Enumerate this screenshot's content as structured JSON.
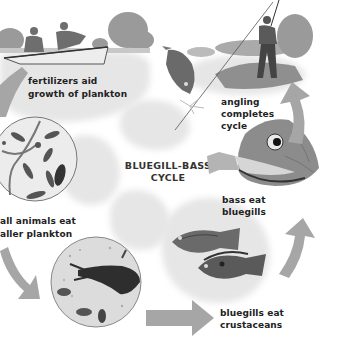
{
  "diagram": {
    "title_line1": "BLUEGILL-BASS",
    "title_line2": "CYCLE",
    "color_mode": "grayscale",
    "arrow_color": "#a6a6a6",
    "stages": [
      {
        "id": "fertilizers",
        "line1": "fertilizers aid",
        "line2": "growth of plankton",
        "illustration": "two men in rowboat fertilizing pond"
      },
      {
        "id": "small-animals",
        "line1": "small animals eat",
        "line2": "smaller plankton",
        "illustration": "magnified plankton circle"
      },
      {
        "id": "crustaceans",
        "line1": "",
        "line2": "",
        "illustration": "magnified crustacean circle"
      },
      {
        "id": "bluegills-eat",
        "line1": "bluegills eat",
        "line2": "crustaceans",
        "illustration": "two bluegill fish"
      },
      {
        "id": "bass-eat",
        "line1": "bass eat",
        "line2": "bluegills",
        "illustration": "bass eating bluegill"
      },
      {
        "id": "angling",
        "line1": "angling",
        "line2": "completes",
        "line3": "cycle",
        "illustration": "angler catching bass"
      }
    ],
    "visible_labels": {
      "fertilizers_1": "fertilizers aid",
      "fertilizers_2": "growth of plankton",
      "small_1": "all animals eat",
      "small_2": "aller plankton",
      "bluegills_1": "bluegills eat",
      "bluegills_2": "crustaceans",
      "bass_1": "bass eat",
      "bass_2": "bluegills",
      "angling_1": "angling",
      "angling_2": "completes",
      "angling_3": "cycle"
    }
  }
}
